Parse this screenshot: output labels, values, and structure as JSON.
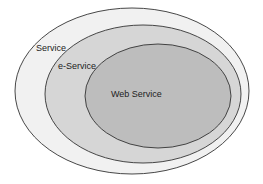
{
  "diagram": {
    "type": "nested-venn",
    "sets": [
      {
        "label": "Service",
        "fill": "#f1f1f1",
        "stroke": "#333333"
      },
      {
        "label": "e-Service",
        "fill": "#d6d6d6",
        "stroke": "#333333"
      },
      {
        "label": "Web Service",
        "fill": "#bdbdbd",
        "stroke": "#333333"
      }
    ]
  }
}
